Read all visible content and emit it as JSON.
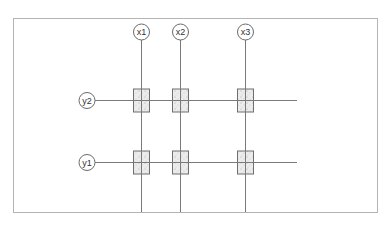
{
  "diagram": {
    "type": "structural-grid-plan",
    "colors": {
      "frame": "#b4b4b4",
      "grid_line": "#7a7a7a",
      "bubble_stroke": "#6a6a6a",
      "label": "#333333",
      "column_fill": "#ececec",
      "column_stroke": "#6f6f6f",
      "stipple": "#9a9a9a"
    },
    "frame": {
      "x": 13,
      "y": 18,
      "width": 364,
      "height": 194
    },
    "vertical_axes": [
      {
        "label": "x1",
        "x": 141
      },
      {
        "label": "x2",
        "x": 180
      },
      {
        "label": "x3",
        "x": 245
      }
    ],
    "horizontal_axes": [
      {
        "label": "y2",
        "y": 100
      },
      {
        "label": "y1",
        "y": 162
      }
    ],
    "bubble_radius": 8,
    "vertical_bubble_y": 32,
    "horizontal_bubble_x": 87,
    "horizontal_line_end_x": 297,
    "column_size": {
      "width": 16,
      "height": 23
    }
  }
}
